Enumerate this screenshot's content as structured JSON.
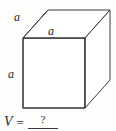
{
  "figure": {
    "name": "cube",
    "shape_label": "cube",
    "stroke_color": "#3a3a3a",
    "fill_color": "#ffffff",
    "background_color": "#fdfdfc",
    "edge_labels": {
      "depth": "a",
      "width": "a",
      "height": "a"
    },
    "geometry": {
      "front_face": [
        [
          23,
          38
        ],
        [
          85,
          38
        ],
        [
          85,
          108
        ],
        [
          23,
          108
        ]
      ],
      "back_offset": [
        25,
        -28
      ],
      "back_top_left": [
        48,
        10
      ],
      "back_top_right": [
        110,
        10
      ],
      "back_bottom_right": [
        110,
        80
      ]
    }
  },
  "formula": {
    "variable": "V",
    "equals": "=",
    "answer_placeholder": "?"
  }
}
